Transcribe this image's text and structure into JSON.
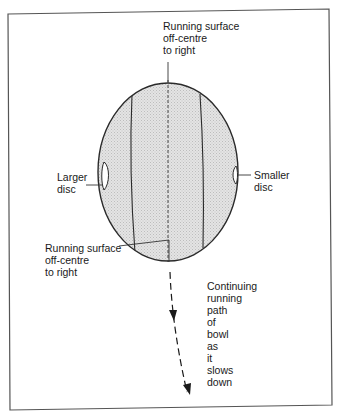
{
  "diagram": {
    "type": "annotated bowl (lawn bowls) running-path illustration",
    "labels": {
      "top_running_surface": [
        "Running surface",
        "off-centre",
        "to right"
      ],
      "bottom_running_surface": [
        "Running surface",
        "off-centre",
        "to right"
      ],
      "larger_disc": [
        "Larger",
        "disc"
      ],
      "smaller_disc": [
        "Smaller",
        "disc"
      ],
      "path": [
        "Continuing",
        "running",
        "path",
        "of",
        "bowl",
        "as",
        "it",
        "slows",
        "down"
      ]
    },
    "colors": {
      "frame": "#555555",
      "outline": "#2a2a2a",
      "bowl_fill": "#dcdcdc",
      "text": "#1a1a1a"
    }
  }
}
